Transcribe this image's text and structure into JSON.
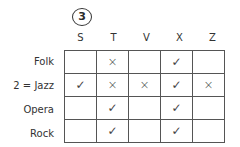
{
  "puzzle_number": "3",
  "columns": [
    "S",
    "T",
    "V",
    "X",
    "Z"
  ],
  "rows": [
    {
      "label": "Folk",
      "cells": [
        "",
        "×",
        "",
        "✓",
        ""
      ]
    },
    {
      "label": "2 = Jazz",
      "cells": [
        "✓",
        "×",
        "×",
        "✓",
        "×"
      ]
    },
    {
      "label": "Opera",
      "cells": [
        "",
        "✓",
        "",
        "✓",
        ""
      ]
    },
    {
      "label": "Rock",
      "cells": [
        "",
        "✓",
        "",
        "✓",
        ""
      ]
    }
  ]
}
